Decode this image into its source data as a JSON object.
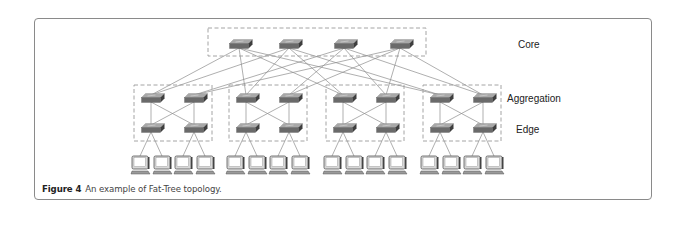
{
  "figure": {
    "number": "Figure 4",
    "caption": "An example of Fat-Tree topology."
  },
  "layers": {
    "core": "Core",
    "aggregation": "Aggregation",
    "edge": "Edge"
  },
  "topology": {
    "type": "fat-tree",
    "k": 4,
    "core_switch_count": 4,
    "pod_count": 4,
    "aggregation_switches_per_pod": 2,
    "edge_switches_per_pod": 2,
    "hosts_per_edge_switch": 2,
    "host_count": 16
  },
  "colors": {
    "frame": "#8a8a8a",
    "dashed_box": "#9a9a9a",
    "link": "#8c8c8c",
    "switch_front": "#6a6a6a",
    "switch_top": "#a8a8a8",
    "switch_side": "#3e3e3e",
    "host_body": "#d8d8d8",
    "host_screen": "#ffffff"
  }
}
